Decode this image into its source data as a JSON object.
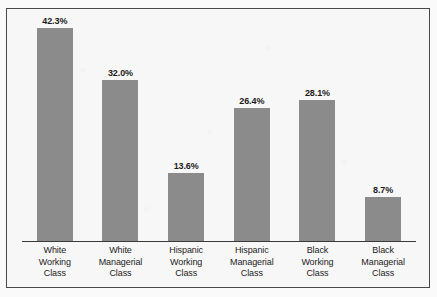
{
  "chart_data": {
    "type": "bar",
    "title": "",
    "subtitle": "",
    "xlabel": "",
    "ylabel": "",
    "ylim": [
      0,
      42.3
    ],
    "grid": false,
    "legend": false,
    "value_suffix": "%",
    "bar_color": "#8b8b8b",
    "categories": [
      "White Working Class",
      "White Managerial Class",
      "Hispanic Working Class",
      "Hispanic Managerial Class",
      "Black Working Class",
      "Black Managerial Class"
    ],
    "category_lines": [
      [
        "White",
        "Working",
        "Class"
      ],
      [
        "White",
        "Managerial",
        "Class"
      ],
      [
        "Hispanic",
        "Working",
        "Class"
      ],
      [
        "Hispanic",
        "Managerial",
        "Class"
      ],
      [
        "Black",
        "Working",
        "Class"
      ],
      [
        "Black",
        "Managerial",
        "Class"
      ]
    ],
    "values": [
      42.3,
      32.0,
      13.6,
      26.4,
      28.1,
      8.7
    ],
    "value_labels": [
      "42.3%",
      "32.0%",
      "13.6%",
      "26.4%",
      "28.1%",
      "8.7%"
    ]
  }
}
